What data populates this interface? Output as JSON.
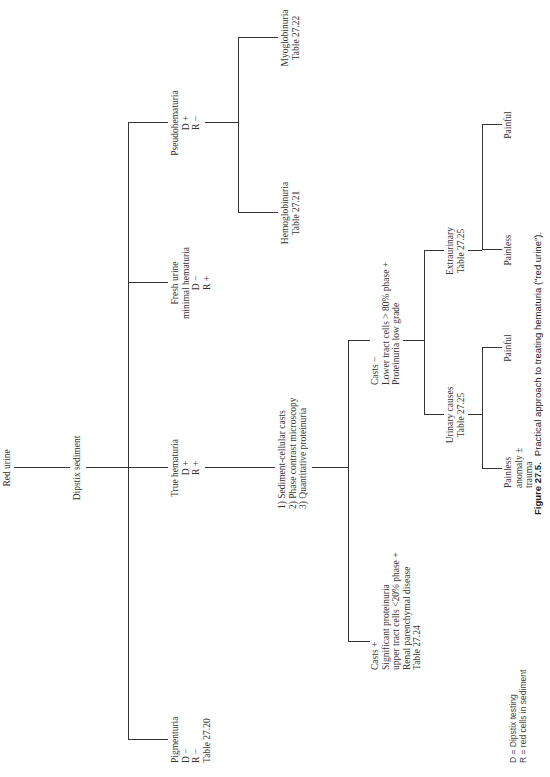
{
  "figure": {
    "caption_label": "Figure 27.5.",
    "caption_text": "Practical approach to treating hematuria (\"red urine\")."
  },
  "nodes": {
    "root": "Red urine",
    "test": "Dipstix sediment",
    "pigmenturia": [
      "Pigmenturia",
      "D −",
      "R −",
      "Table 27.20"
    ],
    "true_hematuria": [
      "True hematuria",
      "D +",
      "R +"
    ],
    "fresh_urine": [
      "Fresh urine",
      "minimal hematuria",
      "D −",
      "R +"
    ],
    "pseudohematuria": [
      "Pseudohematuria",
      "D +",
      "R −"
    ],
    "hemoglobinuria": [
      "Hemoglobinuria",
      "Table 27.21"
    ],
    "myoglobinuria": [
      "Myoglobinuria",
      "Table 27.22"
    ],
    "workup": [
      "1)  Sediment-cellular casts",
      "2)  Phase contrast microscopy",
      "3)  Quantitative proteinuria"
    ],
    "casts_pos": [
      "Casts  +",
      "Significant proteinuria",
      "upper tract cells <20% phase  +",
      "Renal parenchymal disease",
      "Table 27.24"
    ],
    "casts_neg": [
      "Casts  −",
      "Lower tract cells > 80% phase  +",
      "Proteinuria low grade"
    ],
    "urinary_causes": [
      "Urinary causes",
      "Table 27.25"
    ],
    "extraurinary": [
      "Extraurinary",
      "Table 27.25"
    ],
    "urinary_painless": [
      "Painless",
      "anomaly  ±",
      "trauma"
    ],
    "urinary_painful": "Painful",
    "extra_painless": "Painless",
    "extra_painful": "Painful"
  },
  "legend": {
    "d": "D = Dipstix testing",
    "r": "R = red cells in sediment"
  }
}
